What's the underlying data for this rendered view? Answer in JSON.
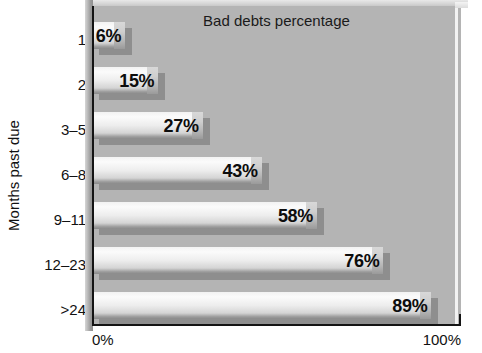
{
  "chart_data": {
    "type": "bar",
    "orientation": "horizontal",
    "title": "Bad debts percentage",
    "xlabel": "",
    "ylabel": "Months past due",
    "categories": [
      "1",
      "2",
      "3–5",
      "6–8",
      "9–11",
      "12–23",
      ">24"
    ],
    "values": [
      6,
      15,
      27,
      43,
      58,
      76,
      89
    ],
    "value_labels": [
      "6%",
      "15%",
      "27%",
      "43%",
      "58%",
      "76%",
      "89%"
    ],
    "xlim": [
      0,
      100
    ],
    "x_tick_labels": [
      "0%",
      "100%"
    ],
    "grid": false,
    "legend": null,
    "unit": "%",
    "style": "3d-shaded-gray-bars"
  },
  "colors": {
    "plot_background": "#b4b4b4",
    "page_background": "#ffffff",
    "axis": "#141414",
    "bar_highlight": "#fbfbfb",
    "bar_shadow": "#8e8e8e",
    "text": "#111111"
  }
}
